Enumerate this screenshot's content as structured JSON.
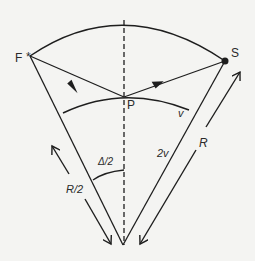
{
  "diagram": {
    "points": {
      "F": {
        "label": "F",
        "x": 30,
        "y": 56
      },
      "S": {
        "label": "S",
        "x": 225,
        "y": 61
      },
      "P": {
        "label": "P",
        "x": 124,
        "y": 97
      },
      "O": {
        "x": 123,
        "y": 245
      }
    },
    "labels": {
      "F": "F",
      "S": "S",
      "P": "P",
      "v": "v",
      "two_v": "2v",
      "R": "R",
      "R_half": "R/2",
      "delta_half": "Δ/2"
    },
    "colors": {
      "stroke": "#1e1e1e",
      "background": "#f4f4f2"
    }
  }
}
